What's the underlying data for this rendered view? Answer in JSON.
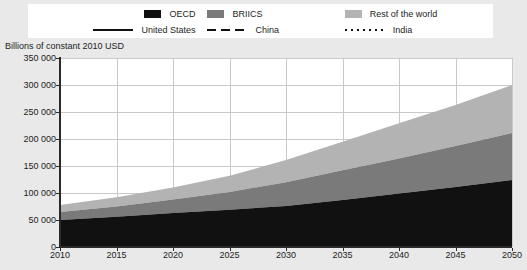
{
  "legend": {
    "row1": [
      {
        "label": "OECD",
        "type": "swatch",
        "color": "#111111",
        "icon": "legend-swatch-oecd"
      },
      {
        "label": "BRIICS",
        "type": "swatch",
        "color": "#7a7a7a",
        "icon": "legend-swatch-briics"
      },
      {
        "label": "Rest of the world",
        "type": "swatch",
        "color": "#b3b3b3",
        "icon": "legend-swatch-rest-of-world"
      }
    ],
    "row2": [
      {
        "label": "United States",
        "type": "line",
        "style": "solid",
        "icon": "legend-line-solid"
      },
      {
        "label": "China",
        "type": "line",
        "style": "dashed",
        "icon": "legend-line-dashed"
      },
      {
        "label": "India",
        "type": "line",
        "style": "dotted",
        "icon": "legend-line-dotted"
      }
    ]
  },
  "axis_title": "Billions of constant 2010 USD",
  "chart_data": {
    "type": "area",
    "title": "",
    "subtitle": "",
    "xlabel": "",
    "ylabel": "Billions of constant 2010 USD",
    "stacked": true,
    "grid": true,
    "legend_position": "top",
    "xlim": [
      2010,
      2050
    ],
    "ylim": [
      0,
      350000
    ],
    "ytick_labels": [
      "350 000",
      "300 000",
      "250 000",
      "200 000",
      "150 000",
      "100 000",
      "50 000",
      "0"
    ],
    "ytick_values": [
      350000,
      300000,
      250000,
      200000,
      150000,
      100000,
      50000,
      0
    ],
    "xtick_labels": [
      "2010",
      "2015",
      "2020",
      "2025",
      "2030",
      "2035",
      "2040",
      "2045",
      "2050"
    ],
    "xtick_values": [
      2010,
      2015,
      2020,
      2025,
      2030,
      2035,
      2040,
      2045,
      2050
    ],
    "x": [
      2010,
      2015,
      2020,
      2025,
      2030,
      2035,
      2040,
      2045,
      2050
    ],
    "series": [
      {
        "name": "OECD",
        "color": "#111111",
        "values": [
          50000,
          56000,
          63000,
          69000,
          76000,
          87000,
          99000,
          111000,
          124000
        ]
      },
      {
        "name": "BRIICS",
        "color": "#7a7a7a",
        "values": [
          15000,
          19000,
          25000,
          33000,
          44000,
          55000,
          65000,
          76000,
          87000
        ]
      },
      {
        "name": "Rest of the world",
        "color": "#b3b3b3",
        "values": [
          13000,
          17000,
          22000,
          30000,
          41000,
          53000,
          65000,
          76000,
          89000
        ]
      }
    ],
    "cumulative": {
      "oecd_top": [
        50000,
        56000,
        63000,
        69000,
        76000,
        87000,
        99000,
        111000,
        124000
      ],
      "briics_top": [
        65000,
        75000,
        88000,
        102000,
        120000,
        142000,
        164000,
        187000,
        211000
      ],
      "total_top": [
        78000,
        92000,
        110000,
        132000,
        161000,
        195000,
        229000,
        263000,
        300000
      ]
    }
  },
  "colors": {
    "page_background": "#e9e9e9",
    "plot_background": "#ffffff",
    "gridline": "#c9c9c9",
    "axis": "#2a2a2a",
    "oecd": "#111111",
    "briics": "#7a7a7a",
    "rest_of_world": "#b3b3b3"
  }
}
